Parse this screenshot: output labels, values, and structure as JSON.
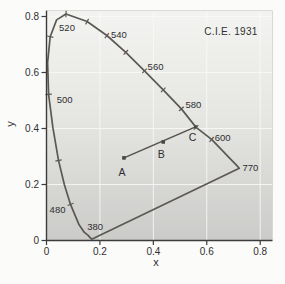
{
  "figure": {
    "background": "#fbfbfa",
    "panel_gradient_top": "#f3f3f1",
    "panel_gradient_mid": "#e6e6e3",
    "panel_gradient_bottom": "#cbcbc9",
    "panel_border_color": "#d8d8d5",
    "grid_color": "#fafaf8",
    "axis_color": "#3c3c3c",
    "text_color": "#2f2f2f",
    "locus_color": "#5c5854",
    "sample_line_color": "#53504c",
    "marker_color": "#4a4641"
  },
  "chart_data": {
    "type": "line",
    "title": "C.I.E. 1931",
    "xlabel": "x",
    "ylabel": "y",
    "xlim": [
      0,
      0.846
    ],
    "ylim": [
      0,
      0.821
    ],
    "grid": true,
    "x_ticks": [
      0,
      0.2,
      0.4,
      0.6,
      0.8
    ],
    "x_tick_labels": [
      "0",
      "0.2",
      "0.4",
      "0.6",
      "0.8"
    ],
    "y_ticks": [
      0,
      0.2,
      0.4,
      0.6,
      0.8
    ],
    "y_tick_labels": [
      "0",
      "0.2",
      "0.4",
      "0.6",
      "0.8"
    ],
    "spectral_locus": [
      [
        380,
        0.171,
        0.005
      ],
      [
        410,
        0.17,
        0.005
      ],
      [
        430,
        0.166,
        0.008
      ],
      [
        450,
        0.155,
        0.019
      ],
      [
        460,
        0.142,
        0.029
      ],
      [
        470,
        0.122,
        0.056
      ],
      [
        480,
        0.09,
        0.129
      ],
      [
        485,
        0.067,
        0.199
      ],
      [
        490,
        0.045,
        0.286
      ],
      [
        495,
        0.024,
        0.403
      ],
      [
        500,
        0.008,
        0.522
      ],
      [
        505,
        0.004,
        0.635
      ],
      [
        510,
        0.014,
        0.728
      ],
      [
        515,
        0.038,
        0.788
      ],
      [
        520,
        0.073,
        0.809
      ],
      [
        530,
        0.152,
        0.782
      ],
      [
        540,
        0.226,
        0.732
      ],
      [
        550,
        0.297,
        0.672
      ],
      [
        560,
        0.367,
        0.606
      ],
      [
        570,
        0.437,
        0.538
      ],
      [
        580,
        0.505,
        0.47
      ],
      [
        590,
        0.56,
        0.404
      ],
      [
        600,
        0.618,
        0.361
      ],
      [
        610,
        0.656,
        0.324
      ],
      [
        620,
        0.681,
        0.299
      ],
      [
        650,
        0.713,
        0.267
      ],
      [
        770,
        0.722,
        0.258
      ]
    ],
    "purple_line_closes_locus": true,
    "locus_tick_wavelengths": [
      480,
      490,
      500,
      510,
      520,
      530,
      540,
      550,
      560,
      570,
      580,
      590,
      600
    ],
    "wavelength_labels": [
      {
        "text": "520",
        "wl": 520,
        "dx": 1,
        "dy": 14
      },
      {
        "text": "540",
        "wl": 540,
        "dx": 12,
        "dy": -1
      },
      {
        "text": "560",
        "wl": 560,
        "dx": 11,
        "dy": -4
      },
      {
        "text": "580",
        "wl": 580,
        "dx": 12,
        "dy": -4
      },
      {
        "text": "600",
        "wl": 600,
        "dx": 11,
        "dy": -2
      },
      {
        "text": "770",
        "wl": 770,
        "dx": 11,
        "dy": -1
      },
      {
        "text": "500",
        "wl": 500,
        "dx": 16,
        "dy": 5
      },
      {
        "text": "480",
        "wl": 480,
        "dx": -13,
        "dy": 5
      },
      {
        "text": "380",
        "wl": 380,
        "dx": 3,
        "dy": -12
      }
    ],
    "sample_points": [
      {
        "label": "A",
        "x": 0.29,
        "y": 0.295,
        "marker": true,
        "ldx": -2,
        "ldy": 15
      },
      {
        "label": "B",
        "x": 0.437,
        "y": 0.352,
        "marker": true,
        "ldx": -2,
        "ldy": 13
      },
      {
        "label": "C",
        "x": 0.558,
        "y": 0.406,
        "marker": true,
        "ldx": -3,
        "ldy": 11
      }
    ],
    "sample_line": {
      "from": "A",
      "to": "C"
    }
  }
}
